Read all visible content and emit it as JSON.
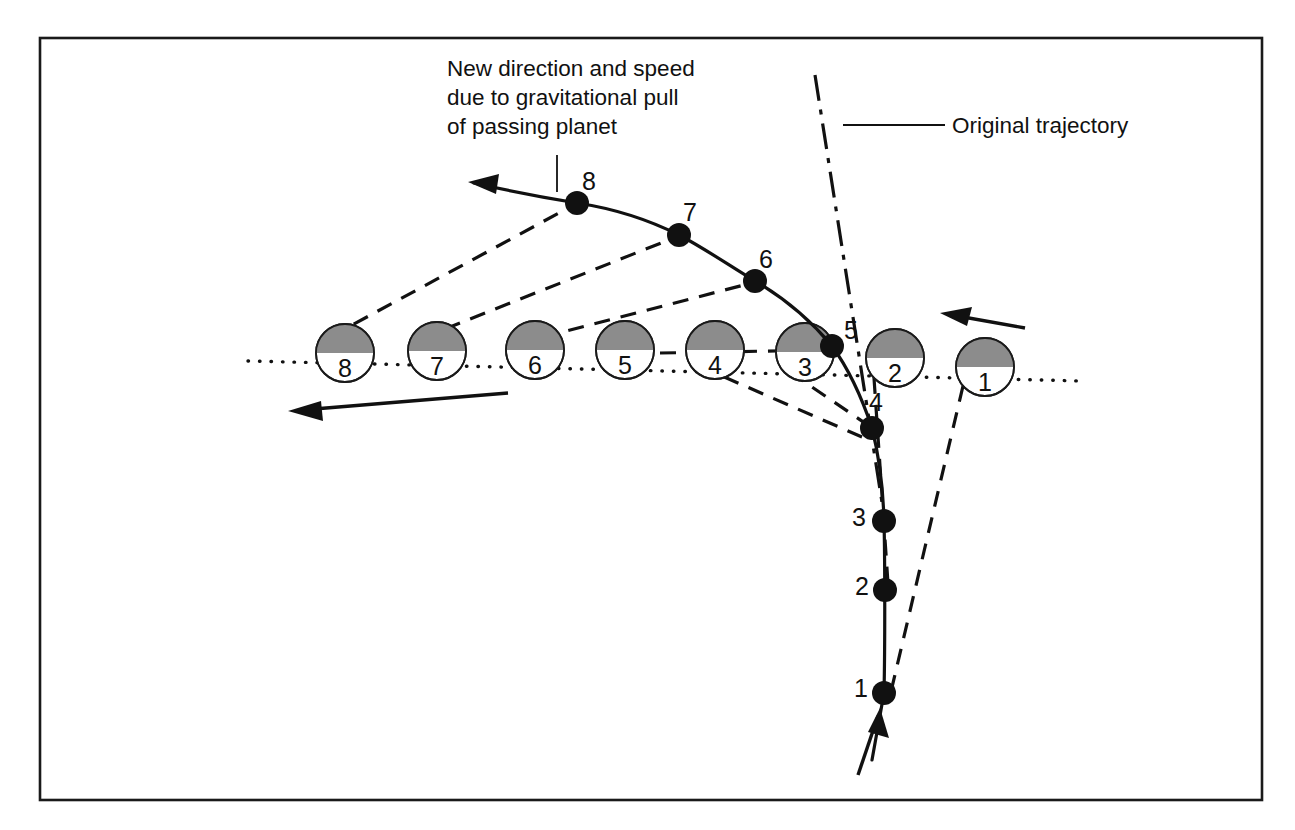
{
  "figure": {
    "background_color": "#ffffff",
    "frame_color": "#1a1a1a",
    "ink_color": "#111111",
    "planet_shade_color": "#8c8c8c"
  },
  "annotations": {
    "new_direction": {
      "lines": [
        "New direction and speed",
        "due to gravitational pull",
        "of passing planet"
      ],
      "line1": "New direction and speed",
      "line2": "due to gravitational pull",
      "line3": "of passing planet"
    },
    "original_trajectory": {
      "label": "Original trajectory"
    }
  },
  "planets": [
    {
      "label": "1",
      "cx": 985,
      "cy": 367,
      "r": 29
    },
    {
      "label": "2",
      "cx": 895,
      "cy": 358,
      "r": 29
    },
    {
      "label": "3",
      "cx": 805,
      "cy": 352,
      "r": 29
    },
    {
      "label": "4",
      "cx": 715,
      "cy": 350,
      "r": 29
    },
    {
      "label": "5",
      "cx": 625,
      "cy": 350,
      "r": 29
    },
    {
      "label": "6",
      "cx": 535,
      "cy": 350,
      "r": 29
    },
    {
      "label": "7",
      "cx": 437,
      "cy": 351,
      "r": 29
    },
    {
      "label": "8",
      "cx": 345,
      "cy": 353,
      "r": 29
    }
  ],
  "spacecraft_points": [
    {
      "label": "1",
      "x": 884,
      "y": 693,
      "label_x": 861,
      "label_y": 690
    },
    {
      "label": "2",
      "x": 885,
      "y": 590,
      "label_x": 862,
      "label_y": 588
    },
    {
      "label": "3",
      "x": 884,
      "y": 521,
      "label_x": 859,
      "label_y": 519
    },
    {
      "label": "4",
      "x": 872,
      "y": 428,
      "label_x": 876,
      "label_y": 404
    },
    {
      "label": "5",
      "x": 832,
      "y": 346,
      "label_x": 848,
      "label_y": 332
    },
    {
      "label": "6",
      "x": 755,
      "y": 281,
      "label_x": 766,
      "label_y": 262
    },
    {
      "label": "7",
      "x": 679,
      "y": 235,
      "label_x": 690,
      "label_y": 215
    },
    {
      "label": "8",
      "x": 577,
      "y": 203,
      "label_x": 589,
      "label_y": 184
    }
  ],
  "velocity_arrows": [
    {
      "name": "planet-velocity-arrow-right",
      "x1": 1025,
      "y1": 327,
      "x2": 944,
      "y2": 314
    },
    {
      "name": "planet-velocity-arrow-left",
      "x1": 508,
      "y1": 393,
      "x2": 290,
      "y2": 411
    }
  ],
  "entry_arrow": {
    "x1": 866,
    "y1": 762,
    "x2": 879,
    "y2": 712
  },
  "exit_arrow": {
    "note": "spacecraft path ends with arrowhead pointing upper-left",
    "tip_x": 470,
    "tip_y": 182
  }
}
